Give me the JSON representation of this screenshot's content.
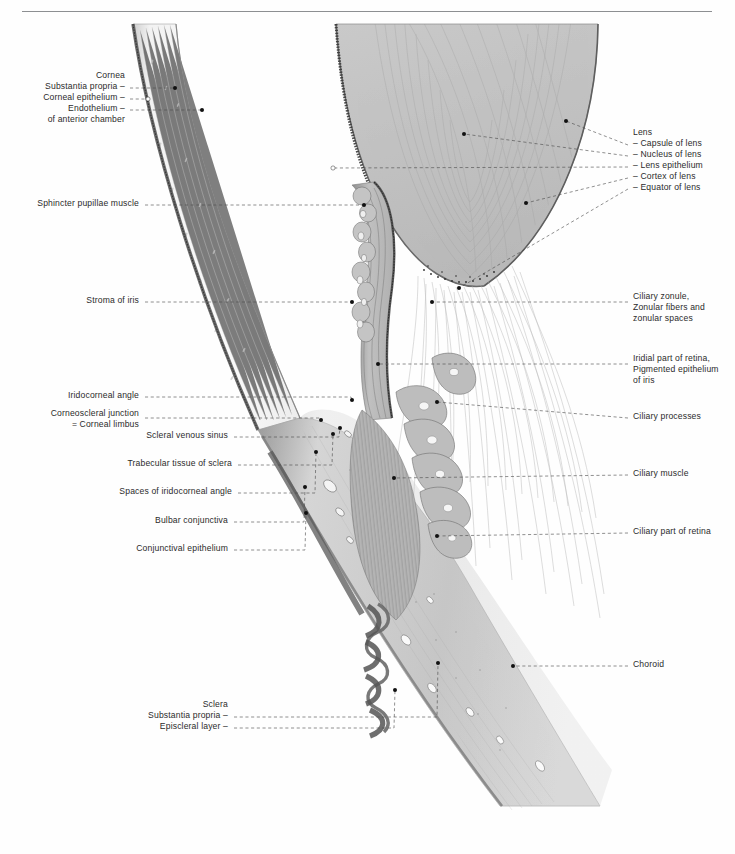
{
  "plate": {
    "title": "Horizontal section through the anterior segment of the human eyeball",
    "background": "#ffffff",
    "rule_color": "#8d8f92"
  },
  "labels_left": [
    {
      "id": "cornea",
      "text": "Cornea",
      "x": 125,
      "y": 77,
      "align": "right",
      "dash": false
    },
    {
      "id": "substantia-propria",
      "text": "Substantia propria –",
      "x": 125,
      "y": 88,
      "align": "right",
      "dash": true
    },
    {
      "id": "corneal-epithelium",
      "text": "Corneal epithelium –",
      "x": 125,
      "y": 99,
      "align": "right",
      "dash": true
    },
    {
      "id": "endothelium",
      "text": "Endothelium –",
      "x": 125,
      "y": 110,
      "align": "right",
      "dash": true
    },
    {
      "id": "of-anterior-chamber",
      "text": "of anterior chamber",
      "x": 125,
      "y": 121,
      "align": "right",
      "dash": false
    },
    {
      "id": "sphincter-pupillae-muscle",
      "text": "Sphincter pupillae muscle",
      "x": 139,
      "y": 205,
      "align": "right",
      "dash": true
    },
    {
      "id": "stroma-of-iris",
      "text": "Stroma of iris",
      "x": 139,
      "y": 302,
      "align": "right",
      "dash": true
    },
    {
      "id": "iridocorneal-angle",
      "text": "Iridocorneal angle",
      "x": 139,
      "y": 397,
      "align": "right",
      "dash": true
    },
    {
      "id": "corneoscleral-junction",
      "text": "Corneoscleral junction",
      "x": 139,
      "y": 415,
      "align": "right",
      "dash": true
    },
    {
      "id": "corneal-limbus",
      "text": "= Corneal limbus",
      "x": 139,
      "y": 426,
      "align": "right",
      "dash": false
    },
    {
      "id": "scleral-venous-sinus",
      "text": "Scleral venous sinus",
      "x": 228,
      "y": 437,
      "align": "right",
      "dash": true
    },
    {
      "id": "trabecular-tissue-of-sclera",
      "text": "Trabecular tissue of sclera",
      "x": 232,
      "y": 465,
      "align": "right",
      "dash": true
    },
    {
      "id": "spaces-of-iridocorneal-angle",
      "text": "Spaces of iridocorneal angle",
      "x": 232,
      "y": 493,
      "align": "right",
      "dash": true
    },
    {
      "id": "bulbar-conjunctiva",
      "text": "Bulbar conjunctiva",
      "x": 228,
      "y": 522,
      "align": "right",
      "dash": true
    },
    {
      "id": "conjunctival-epithelium",
      "text": "Conjunctival epithelium",
      "x": 228,
      "y": 550,
      "align": "right",
      "dash": true
    },
    {
      "id": "sclera",
      "text": "Sclera",
      "x": 228,
      "y": 706,
      "align": "right",
      "dash": false
    },
    {
      "id": "sclera-substantia-propria",
      "text": "Substantia propria –",
      "x": 228,
      "y": 717,
      "align": "right",
      "dash": true
    },
    {
      "id": "episcleral-layer",
      "text": "Episcleral layer –",
      "x": 228,
      "y": 728,
      "align": "right",
      "dash": true
    }
  ],
  "labels_right": [
    {
      "id": "lens",
      "text": "Lens",
      "x": 633,
      "y": 134,
      "align": "left",
      "dash": false
    },
    {
      "id": "capsule-of-lens",
      "text": "– Capsule of lens",
      "x": 633,
      "y": 145,
      "align": "left",
      "dash": true
    },
    {
      "id": "nucleus-of-lens",
      "text": "– Nucleus of lens",
      "x": 633,
      "y": 156,
      "align": "left",
      "dash": true
    },
    {
      "id": "lens-epithelium",
      "text": "– Lens epithelium",
      "x": 633,
      "y": 167,
      "align": "left",
      "dash": true
    },
    {
      "id": "cortex-of-lens",
      "text": "– Cortex of lens",
      "x": 633,
      "y": 178,
      "align": "left",
      "dash": true
    },
    {
      "id": "equator-of-lens",
      "text": "– Equator of lens",
      "x": 633,
      "y": 189,
      "align": "left",
      "dash": true
    },
    {
      "id": "ciliary-zonule",
      "text": "Ciliary zonule,",
      "x": 633,
      "y": 298,
      "align": "left",
      "dash": true
    },
    {
      "id": "zonular-fibers",
      "text": "Zonular fibers and",
      "x": 633,
      "y": 309,
      "align": "left",
      "dash": false
    },
    {
      "id": "zonular-spaces",
      "text": "zonular spaces",
      "x": 633,
      "y": 320,
      "align": "left",
      "dash": false
    },
    {
      "id": "iridial-part-of-retina",
      "text": "Iridial part of retina,",
      "x": 633,
      "y": 360,
      "align": "left",
      "dash": true
    },
    {
      "id": "pigmented-epithelium",
      "text": "Pigmented epithelium",
      "x": 633,
      "y": 371,
      "align": "left",
      "dash": false
    },
    {
      "id": "of-iris",
      "text": "of iris",
      "x": 633,
      "y": 382,
      "align": "left",
      "dash": false
    },
    {
      "id": "ciliary-processes",
      "text": "Ciliary processes",
      "x": 633,
      "y": 418,
      "align": "left",
      "dash": true
    },
    {
      "id": "ciliary-muscle",
      "text": "Ciliary muscle",
      "x": 633,
      "y": 475,
      "align": "left",
      "dash": true
    },
    {
      "id": "ciliary-part-of-retina",
      "text": "Ciliary part of retina",
      "x": 633,
      "y": 533,
      "align": "left",
      "dash": true
    },
    {
      "id": "choroid",
      "text": "Choroid",
      "x": 633,
      "y": 666,
      "align": "left",
      "dash": true
    }
  ],
  "leaders_left": [
    {
      "id": "substantia-propria",
      "y": 88,
      "x1": 130,
      "x2": 175,
      "px": 175,
      "py": 88,
      "marker": "dot"
    },
    {
      "id": "corneal-epithelium",
      "y": 99,
      "x1": 130,
      "x2": 148,
      "px": 148,
      "py": 99,
      "marker": "open"
    },
    {
      "id": "endothelium",
      "y": 110,
      "x1": 130,
      "x2": 202,
      "px": 202,
      "py": 110,
      "marker": "dot"
    },
    {
      "id": "sphincter-pupillae-muscle",
      "y": 205,
      "x1": 145,
      "x2": 364,
      "px": 364,
      "py": 205,
      "marker": "dot"
    },
    {
      "id": "stroma-of-iris",
      "y": 302,
      "x1": 145,
      "x2": 352,
      "px": 352,
      "py": 302,
      "marker": "dot"
    },
    {
      "id": "iridocorneal-angle",
      "y": 397,
      "x1": 145,
      "x2": 352,
      "px": 352,
      "py": 400,
      "marker": "dot"
    },
    {
      "id": "corneoscleral-junction",
      "y": 418,
      "x1": 145,
      "x2": 321,
      "px": 321,
      "py": 420,
      "marker": "dot"
    },
    {
      "id": "scleral-venous-sinus",
      "y": 437,
      "x1": 234,
      "x2": 340,
      "px": 340,
      "py": 428,
      "marker": "dot"
    },
    {
      "id": "trabecular-tissue-of-sclera",
      "y": 465,
      "x1": 238,
      "x2": 333,
      "px": 333,
      "py": 434,
      "marker": "dot"
    },
    {
      "id": "spaces-of-iridocorneal-angle",
      "y": 493,
      "x1": 238,
      "x2": 316,
      "px": 316,
      "py": 452,
      "marker": "dot"
    },
    {
      "id": "bulbar-conjunctiva",
      "y": 522,
      "x1": 234,
      "x2": 305,
      "px": 305,
      "py": 487,
      "marker": "dot"
    },
    {
      "id": "conjunctival-epithelium",
      "y": 550,
      "x1": 234,
      "x2": 306,
      "px": 306,
      "py": 513,
      "marker": "dot"
    },
    {
      "id": "sclera-substantia-propria",
      "y": 717,
      "x1": 234,
      "x2": 438,
      "px": 438,
      "py": 663,
      "marker": "dot"
    },
    {
      "id": "episcleral-layer",
      "y": 728,
      "x1": 234,
      "x2": 395,
      "px": 395,
      "py": 690,
      "marker": "dot"
    }
  ],
  "leaders_right": [
    {
      "id": "capsule-of-lens",
      "x1": 628,
      "y1": 145,
      "px": 566,
      "py": 121,
      "marker": "dot"
    },
    {
      "id": "nucleus-of-lens",
      "x1": 628,
      "y1": 156,
      "px": 464,
      "py": 134,
      "marker": "dot"
    },
    {
      "id": "lens-epithelium",
      "x1": 628,
      "y1": 167,
      "px": 333,
      "py": 168,
      "marker": "open"
    },
    {
      "id": "cortex-of-lens",
      "x1": 628,
      "y1": 178,
      "px": 526,
      "py": 203,
      "marker": "dot"
    },
    {
      "id": "equator-of-lens",
      "x1": 628,
      "y1": 189,
      "px": 459,
      "py": 288,
      "marker": "dot"
    },
    {
      "id": "ciliary-zonule",
      "x1": 628,
      "y1": 302,
      "px": 432,
      "py": 302,
      "marker": "dot"
    },
    {
      "id": "iridial-part-of-retina",
      "x1": 628,
      "y1": 364,
      "px": 378,
      "py": 364,
      "marker": "dot"
    },
    {
      "id": "ciliary-processes",
      "x1": 628,
      "y1": 418,
      "px": 437,
      "py": 402,
      "marker": "dot"
    },
    {
      "id": "ciliary-muscle",
      "x1": 628,
      "y1": 475,
      "px": 394,
      "py": 478,
      "marker": "dot"
    },
    {
      "id": "ciliary-part-of-retina",
      "x1": 628,
      "y1": 533,
      "px": 437,
      "py": 536,
      "marker": "dot"
    },
    {
      "id": "choroid",
      "x1": 628,
      "y1": 666,
      "px": 513,
      "py": 666,
      "marker": "dot"
    }
  ]
}
